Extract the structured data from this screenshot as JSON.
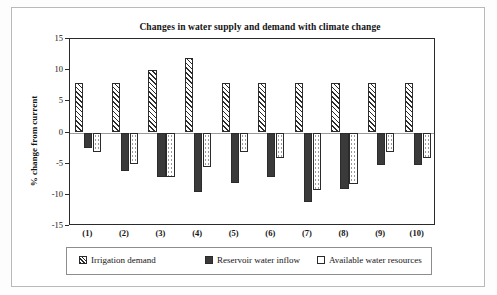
{
  "chart_data": {
    "type": "bar",
    "title": "Changes in water supply and demand with climate change",
    "xlabel": "",
    "ylabel": "% change from current",
    "categories": [
      "(1)",
      "(2)",
      "(3)",
      "(4)",
      "(5)",
      "(6)",
      "(7)",
      "(8)",
      "(9)",
      "(10)"
    ],
    "ylim": [
      -15,
      15
    ],
    "yticks": [
      15,
      10,
      5,
      0,
      -5,
      -10,
      -15
    ],
    "ytick_labels": [
      "15",
      "10",
      "5",
      "0",
      "-5",
      "-10",
      "-15"
    ],
    "grid": false,
    "legend_position": "bottom",
    "series": [
      {
        "name": "Irrigation demand",
        "pattern": "diagonal-hatch",
        "color": "#ffffff",
        "values": [
          8,
          8,
          10,
          12,
          8,
          8,
          8,
          8,
          8,
          8
        ]
      },
      {
        "name": "Reservoir water inflow",
        "pattern": "solid-black",
        "color": "#3a3a3a",
        "values": [
          -2.5,
          -6.2,
          -7.2,
          -9.6,
          -8.1,
          -7.2,
          -11.2,
          -9.1,
          -5.2,
          -5.2
        ]
      },
      {
        "name": "Available water resources",
        "pattern": "dotted-white",
        "color": "#ffffff",
        "values": [
          -3.1,
          -5.0,
          -7.2,
          -5.6,
          -3.1,
          -4.1,
          -9.2,
          -8.2,
          -3.1,
          -4.1
        ]
      }
    ]
  },
  "legend": {
    "entries": [
      {
        "label": "Irrigation demand"
      },
      {
        "label": "Reservoir water inflow"
      },
      {
        "label": "Available water resources"
      }
    ]
  }
}
